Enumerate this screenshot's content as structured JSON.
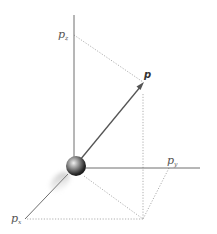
{
  "diagram": {
    "labels": {
      "pz": {
        "main": "p",
        "sub": "z"
      },
      "py": {
        "main": "p",
        "sub": "y"
      },
      "px": {
        "main": "p",
        "sub": "x"
      },
      "p": "p"
    },
    "colors": {
      "axis": "#6e6e6e",
      "vector": "#555555",
      "dotted": "#9a9a9a",
      "sphere_light": "#e8e8e8",
      "sphere_dark": "#1e1e1e"
    }
  }
}
